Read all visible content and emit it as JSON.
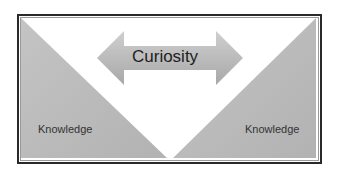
{
  "diagram": {
    "arrow": {
      "label": "Curiosity",
      "direction": "bidirectional",
      "color": "#b8b8b8"
    },
    "left_triangle": {
      "label": "Knowledge",
      "color": "#bdbdbd"
    },
    "right_triangle": {
      "label": "Knowledge",
      "color": "#bdbdbd"
    },
    "frame_border_color": "#2a2a2a"
  }
}
